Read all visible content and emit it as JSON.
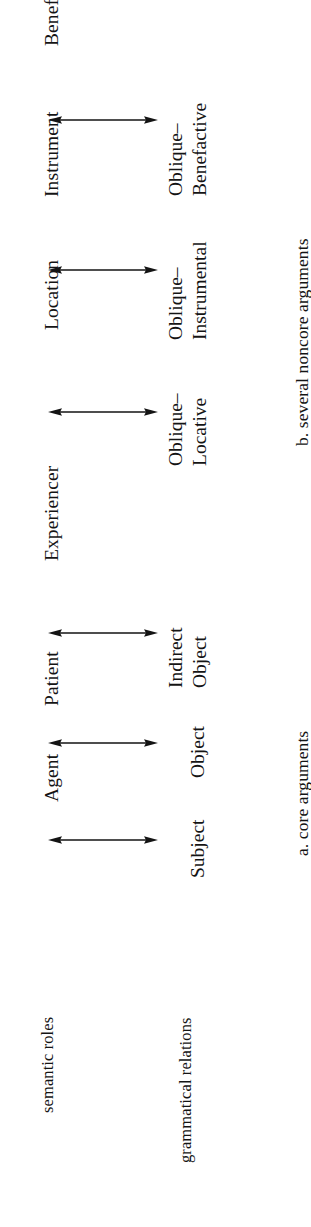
{
  "figure": {
    "orientation": "rotated-90-ccw",
    "ink_color": "#141414",
    "background_color": "#ffffff",
    "axis_labels": {
      "top_row": "semantic roles",
      "bottom_row": "grammatical relations"
    },
    "panels": [
      {
        "id": "b",
        "caption": "b. several noncore arguments",
        "mappings": [
          {
            "semantic_role": "Beneficiary",
            "grammatical_relation_lines": [
              "Oblique–",
              "Benefactive"
            ],
            "arrow": "double-headed-arrow"
          },
          {
            "semantic_role": "Instrument",
            "grammatical_relation_lines": [
              "Oblique–",
              "Instrumental"
            ],
            "arrow": "double-headed-arrow"
          },
          {
            "semantic_role": "Location",
            "grammatical_relation_lines": [
              "Oblique–",
              "Locative"
            ],
            "arrow": "double-headed-arrow"
          }
        ]
      },
      {
        "id": "a",
        "caption": "a. core arguments",
        "mappings": [
          {
            "semantic_role": "Experiencer",
            "grammatical_relation_lines": [
              "Indirect",
              "Object"
            ],
            "arrow": "double-headed-arrow"
          },
          {
            "semantic_role": "Patient",
            "grammatical_relation_lines": [
              "Object"
            ],
            "arrow": "double-headed-arrow"
          },
          {
            "semantic_role": "Agent",
            "grammatical_relation_lines": [
              "Subject"
            ],
            "arrow": "double-headed-arrow"
          }
        ]
      }
    ]
  }
}
